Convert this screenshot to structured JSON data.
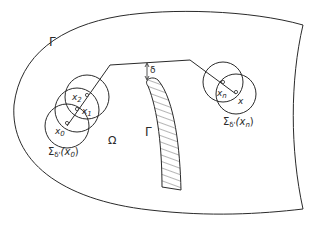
{
  "figure": {
    "boundary_label": "Γ",
    "obstacle_label": "Γ",
    "domain_label": "Ω",
    "delta_label": "δ",
    "points": {
      "x0": {
        "name": "x",
        "sub": "0"
      },
      "x1": {
        "name": "x",
        "sub": "1"
      },
      "x2": {
        "name": "x",
        "sub": "2"
      },
      "xn": {
        "name": "x",
        "sub": "n"
      },
      "x": {
        "name": "x"
      }
    },
    "sigma_start": {
      "symbol": "Σ",
      "sub": "δ'",
      "arg_open": "(x",
      "arg_sub": "0",
      "arg_close": ")"
    },
    "sigma_end": {
      "symbol": "Σ",
      "sub": "δ'",
      "arg_open": "(x",
      "arg_sub": "n",
      "arg_close": ")"
    },
    "colors": {
      "stroke": "#2a2a2a",
      "background": "#ffffff"
    }
  }
}
